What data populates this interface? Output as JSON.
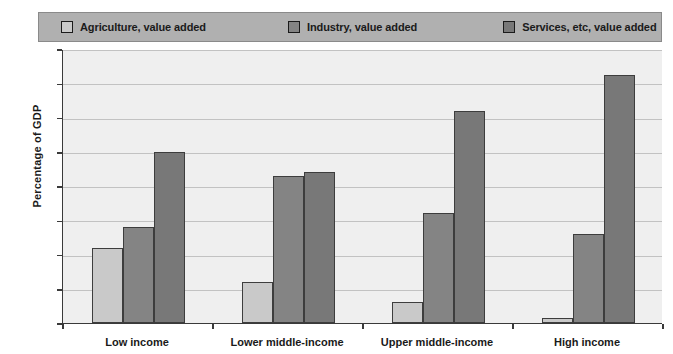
{
  "chart_data": {
    "type": "bar",
    "title": "",
    "xlabel": "",
    "ylabel": "Percentage of GDP",
    "ylim": [
      0,
      80
    ],
    "yticks": [
      0,
      10,
      20,
      30,
      40,
      50,
      60,
      70,
      80
    ],
    "ytick_labels": [
      "0",
      "10",
      "20",
      "30",
      "40",
      "50",
      "60",
      "70",
      "80"
    ],
    "grid": true,
    "legend_position": "top",
    "categories": [
      "Low income",
      "Lower middle-income",
      "Upper middle-income",
      "High income"
    ],
    "series": [
      {
        "name": "Agriculture, value added",
        "color": "#c9c9c9",
        "values": [
          22,
          12,
          6,
          1.5
        ]
      },
      {
        "name": "Industry, value added",
        "color": "#848484",
        "values": [
          28,
          43,
          32,
          26
        ]
      },
      {
        "name": "Services, etc, value added",
        "color": "#787878",
        "values": [
          50,
          44,
          62,
          72.5
        ]
      }
    ],
    "colors": {
      "plot_background": "#efefef",
      "legend_background": "#b0b0b0",
      "gridline": "#c2c2c2",
      "axis": "#3a3a3a",
      "text": "#1a1a1a",
      "bar_outline": "#3d3d3d"
    }
  }
}
